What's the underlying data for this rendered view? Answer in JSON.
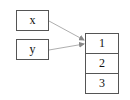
{
  "variables": [
    {
      "name": "x"
    },
    {
      "name": "y"
    }
  ],
  "array": {
    "cells": [
      "1",
      "2",
      "3"
    ]
  },
  "colors": {
    "stroke": "#555555",
    "arrow": "#888888"
  }
}
